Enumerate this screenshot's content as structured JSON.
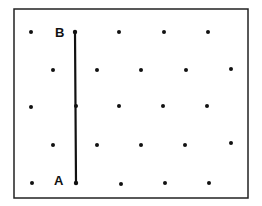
{
  "diagram": {
    "type": "dot-grid-with-segment",
    "colors": {
      "ink": "#111111",
      "background": "#ffffff",
      "border": "#222222"
    },
    "frame": {
      "x1": 14,
      "y1": 9,
      "x2": 248,
      "y2": 198
    },
    "dots": [
      {
        "x": 31,
        "y": 32
      },
      {
        "x": 119,
        "y": 32
      },
      {
        "x": 164,
        "y": 32
      },
      {
        "x": 208,
        "y": 32
      },
      {
        "x": 53,
        "y": 70
      },
      {
        "x": 97,
        "y": 70
      },
      {
        "x": 141,
        "y": 70
      },
      {
        "x": 186,
        "y": 70
      },
      {
        "x": 231,
        "y": 69
      },
      {
        "x": 31,
        "y": 107
      },
      {
        "x": 76,
        "y": 106
      },
      {
        "x": 119,
        "y": 106
      },
      {
        "x": 163,
        "y": 106
      },
      {
        "x": 207,
        "y": 106
      },
      {
        "x": 53,
        "y": 145
      },
      {
        "x": 97,
        "y": 145
      },
      {
        "x": 141,
        "y": 145
      },
      {
        "x": 185,
        "y": 145
      },
      {
        "x": 231,
        "y": 143
      },
      {
        "x": 32,
        "y": 183
      },
      {
        "x": 121,
        "y": 184
      },
      {
        "x": 165,
        "y": 183
      },
      {
        "x": 209,
        "y": 183
      }
    ],
    "segment": {
      "from": {
        "label": "A",
        "x": 76,
        "y": 183
      },
      "to": {
        "label": "B",
        "x": 75,
        "y": 32
      }
    },
    "labels": {
      "point_b": {
        "text": "B",
        "x": 55,
        "y": 37
      },
      "point_a": {
        "text": "A",
        "x": 54,
        "y": 185
      }
    }
  }
}
